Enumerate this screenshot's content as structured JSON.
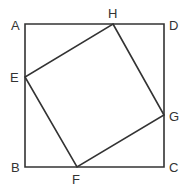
{
  "diagram": {
    "stroke_color": "#333333",
    "outer_square": {
      "label": "ABCD",
      "vertices": {
        "A": {
          "label": "A",
          "x": 25,
          "y": 24
        },
        "D": {
          "label": "D",
          "x": 164,
          "y": 24
        },
        "C": {
          "label": "C",
          "x": 164,
          "y": 167
        },
        "B": {
          "label": "B",
          "x": 25,
          "y": 167
        }
      }
    },
    "inner_square": {
      "label": "EFGH",
      "vertices": {
        "H": {
          "label": "H",
          "x": 113,
          "y": 24
        },
        "G": {
          "label": "G",
          "x": 164,
          "y": 115
        },
        "F": {
          "label": "F",
          "x": 77,
          "y": 167
        },
        "E": {
          "label": "E",
          "x": 25,
          "y": 77
        }
      }
    }
  }
}
